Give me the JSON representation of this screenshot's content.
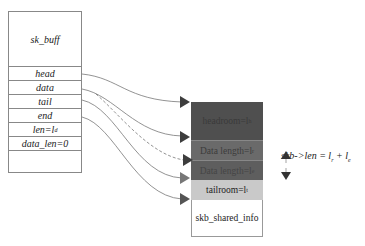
{
  "diagram": {
    "sk_buff": {
      "title": "sk_buff",
      "fields": [
        {
          "label": "head"
        },
        {
          "label": "data"
        },
        {
          "label": "tail"
        },
        {
          "label": "end"
        },
        {
          "label": "len=l",
          "sub": "d"
        },
        {
          "label": "data_len=0"
        }
      ]
    },
    "buffer": {
      "segments": [
        {
          "label": "headroom=l",
          "sub": "h",
          "color": "#4f4f4f"
        },
        {
          "label": "Data length=l",
          "sub": "r",
          "color": "#6a6a6a"
        },
        {
          "label": "Data length=l",
          "sub": "e",
          "color": "#5e5e5e"
        },
        {
          "label": "tailroom=l",
          "sub": "t",
          "color": "#c9c9c9"
        },
        {
          "label": "skb_shared_info",
          "color": "#ffffff"
        }
      ]
    },
    "formula": {
      "text": "skb->len = l",
      "sub1": "r",
      "plus": " + l",
      "sub2": "e"
    },
    "arrows": [
      {
        "from": "head",
        "to": "headroom",
        "style": "solid"
      },
      {
        "from": "data",
        "to": "data-length-1",
        "style": "solid"
      },
      {
        "from": "data",
        "to": "data-length-2",
        "style": "dashed"
      },
      {
        "from": "tail",
        "to": "tailroom",
        "style": "solid"
      },
      {
        "from": "end",
        "to": "skb_shared_info",
        "style": "solid"
      }
    ]
  }
}
